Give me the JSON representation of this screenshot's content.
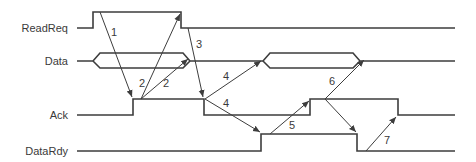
{
  "diagram": {
    "type": "timing-diagram",
    "signals": [
      {
        "name": "ReadReq",
        "label": "ReadReq"
      },
      {
        "name": "Data",
        "label": "Data"
      },
      {
        "name": "Ack",
        "label": "Ack"
      },
      {
        "name": "DataRdy",
        "label": "DataRdy"
      }
    ],
    "arrows": [
      {
        "id": "1",
        "label": "1",
        "from": "ReadReq rise",
        "to": "Ack rise"
      },
      {
        "id": "2a",
        "label": "2",
        "from": "Ack rise",
        "to": "ReadReq fall"
      },
      {
        "id": "2b",
        "label": "2",
        "from": "Ack rise",
        "to": "Data end"
      },
      {
        "id": "3",
        "label": "3",
        "from": "ReadReq fall",
        "to": "Ack fall"
      },
      {
        "id": "4a",
        "label": "4",
        "from": "Ack fall",
        "to": "Data start"
      },
      {
        "id": "4b",
        "label": "4",
        "from": "Ack fall",
        "to": "DataRdy rise"
      },
      {
        "id": "5",
        "label": "5",
        "from": "DataRdy rise",
        "to": "Ack rise"
      },
      {
        "id": "6",
        "label": "6",
        "from": "Ack rise",
        "to": "Data end / DataRdy fall"
      },
      {
        "id": "7",
        "label": "7",
        "from": "DataRdy fall",
        "to": "Ack fall"
      }
    ],
    "colors": {
      "line": "#3d3d3d",
      "text": "#3a3a3a",
      "background": "#ffffff"
    }
  }
}
